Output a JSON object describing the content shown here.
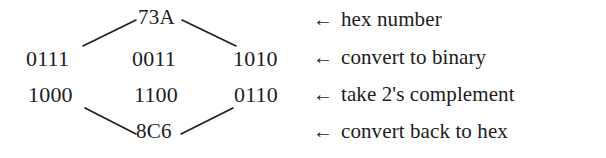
{
  "figure": {
    "ink_color": "#1c1c1c",
    "background_color": "#ffffff"
  },
  "nodes": {
    "hex_top": "73A",
    "hex_bottom": "8C6"
  },
  "rows": [
    {
      "id": "binary-original",
      "cells": [
        "0111",
        "0011",
        "1010"
      ]
    },
    {
      "id": "binary-complement",
      "cells": [
        "1000",
        "1100",
        "0110"
      ]
    }
  ],
  "annotations": [
    {
      "arrow": "←",
      "note": "hex number"
    },
    {
      "arrow": "←",
      "note": "convert to binary"
    },
    {
      "arrow": "←",
      "note": "take 2's complement"
    },
    {
      "arrow": "←",
      "note": "convert back to hex"
    }
  ],
  "connectors": [
    {
      "id": "top-left",
      "from": "hex_top",
      "to": "binary-original-col1"
    },
    {
      "id": "top-right",
      "from": "hex_top",
      "to": "binary-original-col3"
    },
    {
      "id": "bottom-left",
      "from": "binary-complement-col1",
      "to": "hex_bottom"
    },
    {
      "id": "bottom-right",
      "from": "binary-complement-col3",
      "to": "hex_bottom"
    }
  ]
}
